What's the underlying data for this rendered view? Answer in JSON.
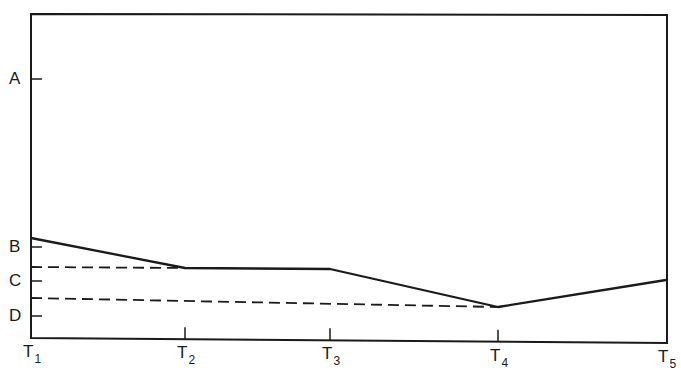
{
  "chart_data": {
    "type": "line",
    "title": "",
    "xlabel": "",
    "ylabel": "",
    "x_ticks": [
      {
        "label": "T",
        "sub": "1",
        "x": 31
      },
      {
        "label": "T",
        "sub": "2",
        "x": 185
      },
      {
        "label": "T",
        "sub": "3",
        "x": 330
      },
      {
        "label": "T",
        "sub": "4",
        "x": 498
      },
      {
        "label": "T",
        "sub": "5",
        "x": 666
      }
    ],
    "y_ticks": [
      {
        "label": "A",
        "y": 79
      },
      {
        "label": "B",
        "y": 247
      },
      {
        "label": "C",
        "y": 281
      },
      {
        "label": "D",
        "y": 316
      }
    ],
    "series": [
      {
        "name": "solid-line",
        "style": "solid",
        "points": [
          [
            31,
            238
          ],
          [
            185,
            268
          ],
          [
            330,
            269
          ],
          [
            498,
            307
          ],
          [
            666,
            280
          ]
        ],
        "levels": [
          "above B",
          "between B and C",
          "between B and C",
          "between C and D",
          "between B and C"
        ]
      },
      {
        "name": "dashed-line-upper",
        "style": "dashed",
        "points": [
          [
            31,
            267
          ],
          [
            185,
            268
          ]
        ]
      },
      {
        "name": "dashed-line-lower",
        "style": "dashed",
        "points": [
          [
            31,
            298
          ],
          [
            498,
            307
          ]
        ]
      }
    ],
    "frame": {
      "left": 31,
      "top": 14,
      "right": 667,
      "bottom": 340
    },
    "grid": false,
    "legend": null
  },
  "colors": {
    "ink": "#1a1a1a",
    "background": "#ffffff"
  }
}
